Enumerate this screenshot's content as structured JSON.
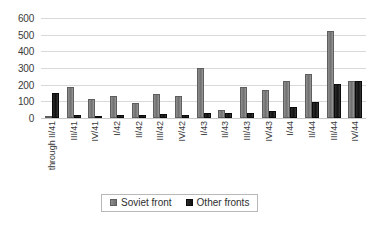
{
  "chart_data": {
    "type": "bar",
    "title": "",
    "subtitle": "",
    "xlabel": "",
    "ylabel": "",
    "ylim": [
      0,
      600
    ],
    "ytick_step": 100,
    "yticks": [
      "600",
      "500",
      "400",
      "300",
      "200",
      "100",
      "0"
    ],
    "grid": true,
    "legend_position": "bottom",
    "orientation": "vertical",
    "grouping": "grouped",
    "xtick_rotation": 90,
    "categories": [
      "through II/41",
      "III/41",
      "IV/41",
      "I/42",
      "II/42",
      "III/42",
      "IV/42",
      "I/43",
      "II/43",
      "III/43",
      "IV/43",
      "I/44",
      "II/44",
      "III/44",
      "IV/44"
    ],
    "series": [
      {
        "name": "Soviet front",
        "color": "#7a7a7a",
        "values": [
          0,
          185,
          115,
          135,
          90,
          145,
          135,
          300,
          50,
          185,
          170,
          225,
          265,
          520,
          225
        ]
      },
      {
        "name": "Other fronts",
        "color": "#141414",
        "values": [
          150,
          20,
          15,
          20,
          20,
          25,
          20,
          30,
          28,
          30,
          40,
          65,
          98,
          205,
          225
        ]
      }
    ]
  },
  "legend": {
    "items": [
      {
        "label": "Soviet front",
        "swatch": "soviet-swatch"
      },
      {
        "label": "Other fronts",
        "swatch": "other-swatch"
      }
    ]
  }
}
